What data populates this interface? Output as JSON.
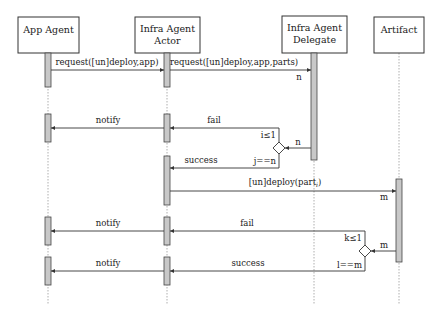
{
  "diagram": {
    "type": "sequence-diagram",
    "participants": [
      {
        "id": "app",
        "line1": "App Agent",
        "line2": ""
      },
      {
        "id": "actor",
        "line1": "Infra Agent",
        "line2": "Actor"
      },
      {
        "id": "delegate",
        "line1": "Infra Agent",
        "line2": "Delegate"
      },
      {
        "id": "artifact",
        "line1": "Artifact",
        "line2": ""
      }
    ],
    "messages": [
      {
        "from": "app",
        "to": "actor",
        "label": "request([un]deploy,app)"
      },
      {
        "from": "actor",
        "to": "delegate",
        "label": "request([un]deploy,app,parts)",
        "multiplicity": "n"
      },
      {
        "from": "actor",
        "to": "app",
        "label": "notify"
      },
      {
        "from": "delegate",
        "to": "actor",
        "label": "fail",
        "condition": "i≤1"
      },
      {
        "from": "delegate",
        "to": "actor",
        "label": "success",
        "condition": "j==n"
      },
      {
        "from": "delegate",
        "to": "decision",
        "label": "n"
      },
      {
        "from": "actor",
        "to": "artifact",
        "label": "[un]deploy(part",
        "subscript": "i",
        "suffix": ")",
        "multiplicity": "m"
      },
      {
        "from": "actor",
        "to": "app",
        "label": "notify"
      },
      {
        "from": "artifact",
        "to": "actor",
        "label": "fail",
        "condition": "k≤1"
      },
      {
        "from": "actor",
        "to": "app",
        "label": "notify"
      },
      {
        "from": "artifact",
        "to": "actor",
        "label": "success",
        "condition": "l==m"
      },
      {
        "from": "artifact",
        "to": "decision",
        "label": "m"
      }
    ]
  }
}
